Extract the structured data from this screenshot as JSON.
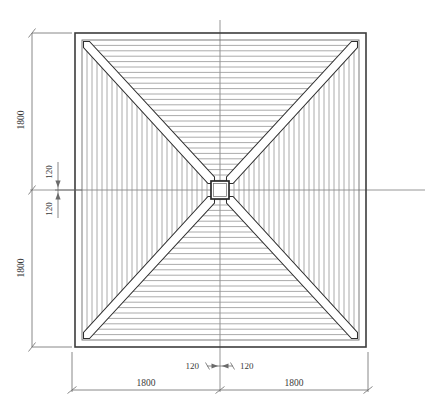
{
  "drawing": {
    "type": "hip-roof-framing-plan",
    "title": "",
    "units": "mm",
    "colors": {
      "outline": "#3c3c3c",
      "plate": "#6e6e6e",
      "rafter": "#8c8c8c",
      "hip": "#2f2f2f",
      "centerline": "#7a7a7a",
      "dimension": "#6b6b6b",
      "text": "#3a3a3a",
      "background": "#ffffff"
    },
    "geometry": {
      "outer_left": 75,
      "outer_top": 33,
      "outer_right": 366,
      "outer_bottom": 347,
      "plate_inset": 7,
      "center_x": 220,
      "center_y": 190,
      "post_half": 9,
      "rafter_count_per_side": 26,
      "hip_thickness": 5
    }
  },
  "dimensions": {
    "left_vertical": {
      "upper_label": "1800",
      "lower_label": "1800"
    },
    "bottom_horizontal": {
      "left_label": "1800",
      "right_label": "1800"
    },
    "center_vertical_detail": {
      "upper_label": "120",
      "lower_label": "120"
    },
    "center_horizontal_detail": {
      "left_label": "120",
      "right_label": "120"
    }
  },
  "annotations": {
    "centerline_vertical": "vertical-centerline",
    "centerline_horizontal": "horizontal-centerline"
  }
}
